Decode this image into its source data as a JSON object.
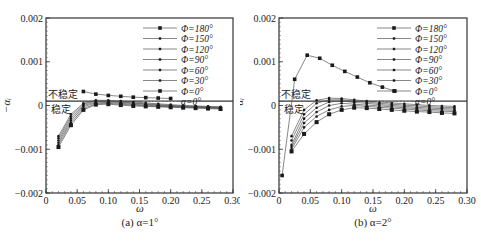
{
  "chart_data": [
    {
      "type": "line",
      "panel": "a",
      "title": "",
      "caption": "(a) α=1°",
      "xlabel": "ω",
      "ylabel": "−α_i",
      "xlim": [
        0,
        0.3
      ],
      "ylim": [
        -0.002,
        0.002
      ],
      "xticks": [
        "0",
        "0.05",
        "0.10",
        "0.15",
        "0.20",
        "0.25",
        "0.30"
      ],
      "yticks": [
        "0.002",
        "0.001",
        "0",
        "−0.001",
        "−0.002"
      ],
      "grid": false,
      "legend_position": "upper right",
      "annotations": [
        {
          "text": "不稳定",
          "x": 0.005,
          "y": 0.00025
        },
        {
          "text": "稳定",
          "x": 0.008,
          "y": -5e-05
        }
      ],
      "reference_line": {
        "name": "α=0°",
        "y": 0.0001
      },
      "series": [
        {
          "name": "Φ=180°",
          "x": [
            0.06,
            0.08,
            0.1,
            0.12,
            0.14,
            0.16,
            0.18,
            0.2
          ],
          "y": [
            0.00032,
            0.00026,
            0.00023,
            0.00021,
            0.00019,
            0.00018,
            0.00017,
            0.00016
          ]
        },
        {
          "name": "Φ=150°",
          "x": [
            0.02,
            0.04,
            0.06,
            0.08,
            0.1,
            0.12,
            0.14,
            0.16,
            0.18,
            0.2,
            0.22,
            0.24,
            0.26,
            0.28
          ],
          "y": [
            -0.0007,
            -0.0002,
            5e-05,
            0.00012,
            0.00012,
            0.0001,
            8e-05,
            6e-05,
            4e-05,
            2e-05,
            0.0,
            -1e-05,
            -2e-05,
            -3e-05
          ]
        },
        {
          "name": "Φ=120°",
          "x": [
            0.02,
            0.04,
            0.06,
            0.08,
            0.1,
            0.12,
            0.14,
            0.16,
            0.18,
            0.2,
            0.22,
            0.24,
            0.26,
            0.28
          ],
          "y": [
            -0.00075,
            -0.00025,
            3e-05,
            0.0001,
            0.0001,
            8e-05,
            6e-05,
            4e-05,
            2e-05,
            0.0,
            -1e-05,
            -2e-05,
            -3e-05,
            -4e-05
          ]
        },
        {
          "name": "Φ=90°",
          "x": [
            0.02,
            0.04,
            0.06,
            0.08,
            0.1,
            0.12,
            0.14,
            0.16,
            0.18,
            0.2,
            0.22,
            0.24,
            0.26,
            0.28
          ],
          "y": [
            -0.0008,
            -0.0003,
            0.0,
            8e-05,
            9e-05,
            7e-05,
            5e-05,
            3e-05,
            1e-05,
            -1e-05,
            -2e-05,
            -3e-05,
            -4e-05,
            -5e-05
          ]
        },
        {
          "name": "Φ=60°",
          "x": [
            0.02,
            0.04,
            0.06,
            0.08,
            0.1,
            0.12,
            0.14,
            0.16,
            0.18,
            0.2,
            0.22,
            0.24,
            0.26,
            0.28
          ],
          "y": [
            -0.00085,
            -0.00035,
            -3e-05,
            6e-05,
            7e-05,
            5e-05,
            3e-05,
            1e-05,
            -1e-05,
            -2e-05,
            -3e-05,
            -4e-05,
            -5e-05,
            -6e-05
          ]
        },
        {
          "name": "Φ=30°",
          "x": [
            0.02,
            0.04,
            0.06,
            0.08,
            0.1,
            0.12,
            0.14,
            0.16,
            0.18,
            0.2,
            0.22,
            0.24,
            0.26,
            0.28
          ],
          "y": [
            -0.0009,
            -0.0004,
            -7e-05,
            4e-05,
            5e-05,
            3e-05,
            1e-05,
            -1e-05,
            -2e-05,
            -3e-05,
            -4e-05,
            -5e-05,
            -6e-05,
            -7e-05
          ]
        },
        {
          "name": "Φ=0°",
          "x": [
            0.02,
            0.04,
            0.06,
            0.08,
            0.1,
            0.12,
            0.14,
            0.16,
            0.18,
            0.2,
            0.22,
            0.24,
            0.26,
            0.28
          ],
          "y": [
            -0.00095,
            -0.00045,
            -0.0001,
            2e-05,
            3e-05,
            1e-05,
            -1e-05,
            -2e-05,
            -3e-05,
            -4e-05,
            -5e-05,
            -6e-05,
            -7e-05,
            -8e-05
          ]
        }
      ]
    },
    {
      "type": "line",
      "panel": "b",
      "title": "",
      "caption": "(b) α=2°",
      "xlabel": "ω",
      "ylabel": "−α_i",
      "xlim": [
        0,
        0.3
      ],
      "ylim": [
        -0.002,
        0.002
      ],
      "xticks": [
        "0",
        "0.05",
        "0.10",
        "0.15",
        "0.20",
        "0.25",
        "0.30"
      ],
      "yticks": [
        "0.002",
        "0.001",
        "0",
        "−0.001",
        "−0.002"
      ],
      "grid": false,
      "legend_position": "upper right",
      "annotations": [
        {
          "text": "不稳定",
          "x": 0.005,
          "y": 0.00025
        },
        {
          "text": "稳定",
          "x": 0.008,
          "y": -5e-05
        }
      ],
      "reference_line": {
        "name": "α=0°",
        "y": 0.0001
      },
      "series": [
        {
          "name": "Φ=180°",
          "x": [
            0.005,
            0.025,
            0.045,
            0.065,
            0.085,
            0.105,
            0.125,
            0.145,
            0.165,
            0.185
          ],
          "y": [
            -0.0016,
            0.0006,
            0.00115,
            0.00108,
            0.00092,
            0.00078,
            0.00065,
            0.00052,
            0.00042,
            0.00033
          ]
        },
        {
          "name": "Φ=150°",
          "x": [
            0.02,
            0.04,
            0.06,
            0.08,
            0.1,
            0.12,
            0.14,
            0.16,
            0.18,
            0.2,
            0.22,
            0.24,
            0.26,
            0.28
          ],
          "y": [
            -0.0007,
            -0.0001,
            0.00012,
            0.00017,
            0.00016,
            0.00013,
            0.0001,
            8e-05,
            6e-05,
            4e-05,
            2e-05,
            0.0,
            -1e-05,
            -2e-05
          ]
        },
        {
          "name": "Φ=120°",
          "x": [
            0.02,
            0.04,
            0.06,
            0.08,
            0.1,
            0.12,
            0.14,
            0.16,
            0.18,
            0.2,
            0.22,
            0.24,
            0.26,
            0.28
          ],
          "y": [
            -0.0008,
            -0.0002,
            5e-05,
            0.00013,
            0.00013,
            0.0001,
            8e-05,
            5e-05,
            3e-05,
            1e-05,
            -1e-05,
            -3e-05,
            -4e-05,
            -5e-05
          ]
        },
        {
          "name": "Φ=90°",
          "x": [
            0.02,
            0.04,
            0.06,
            0.08,
            0.1,
            0.12,
            0.14,
            0.16,
            0.18,
            0.2,
            0.22,
            0.24,
            0.26,
            0.28
          ],
          "y": [
            -0.0009,
            -0.0003,
            -5e-05,
            8e-05,
            0.0001,
            7e-05,
            5e-05,
            2e-05,
            0.0,
            -2e-05,
            -4e-05,
            -6e-05,
            -7e-05,
            -8e-05
          ]
        },
        {
          "name": "Φ=60°",
          "x": [
            0.02,
            0.04,
            0.06,
            0.08,
            0.1,
            0.12,
            0.14,
            0.16,
            0.18,
            0.2,
            0.22,
            0.24,
            0.26,
            0.28
          ],
          "y": [
            -0.00095,
            -0.0004,
            -0.00015,
            0.0,
            5e-05,
            3e-05,
            1e-05,
            -1e-05,
            -3e-05,
            -5e-05,
            -7e-05,
            -9e-05,
            -0.0001,
            -0.00011
          ]
        },
        {
          "name": "Φ=30°",
          "x": [
            0.02,
            0.04,
            0.06,
            0.08,
            0.1,
            0.12,
            0.14,
            0.16,
            0.18,
            0.2,
            0.22,
            0.24,
            0.26,
            0.28
          ],
          "y": [
            -0.001,
            -0.0005,
            -0.00025,
            -0.0001,
            -2e-05,
            0.0,
            -2e-05,
            -4e-05,
            -6e-05,
            -8e-05,
            -0.0001,
            -0.00012,
            -0.00013,
            -0.00014
          ]
        },
        {
          "name": "Φ=0°",
          "x": [
            0.02,
            0.04,
            0.06,
            0.08,
            0.1,
            0.12,
            0.14,
            0.16,
            0.18,
            0.2,
            0.22,
            0.24,
            0.26,
            0.28
          ],
          "y": [
            -0.00105,
            -0.00065,
            -0.00038,
            -0.0002,
            -0.0001,
            -5e-05,
            -6e-05,
            -8e-05,
            -0.0001,
            -0.00012,
            -0.00014,
            -0.00015,
            -0.00017,
            -0.00018
          ]
        }
      ]
    }
  ],
  "panels": {
    "a": {
      "caption": "(a) α=1°",
      "xlabel": "ω",
      "ylabel": "−αᵢ",
      "unstable_label": "不稳定",
      "stable_label": "稳定"
    },
    "b": {
      "caption": "(b) α=2°",
      "xlabel": "ω",
      "ylabel": "−αᵢ",
      "unstable_label": "不稳定",
      "stable_label": "稳定"
    }
  },
  "legend": [
    "Φ=180°",
    "Φ=150°",
    "Φ=120°",
    "Φ=90°",
    "Φ=60°",
    "Φ=30°",
    "Φ=0°",
    "α=0°"
  ],
  "colors": {
    "axis": "#333333",
    "series": "#555555",
    "marker": "#1a1a1a",
    "reference": "#777777"
  }
}
